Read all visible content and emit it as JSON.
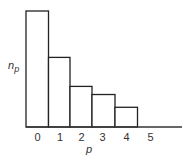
{
  "chart_data": {
    "type": "bar",
    "subtype": "histogram",
    "title": "",
    "xlabel": "p",
    "ylabel": "n_p",
    "ylabel_main": "n",
    "ylabel_sub": "p",
    "categories": [
      "0",
      "1",
      "2",
      "3",
      "4",
      "5"
    ],
    "values": [
      100,
      60,
      35,
      28,
      17,
      0
    ],
    "ylim": [
      0,
      100
    ],
    "y_ticks_shown": false,
    "grid": false,
    "legend": null,
    "bar_fill": "#ffffff",
    "bar_stroke": "#222222"
  }
}
